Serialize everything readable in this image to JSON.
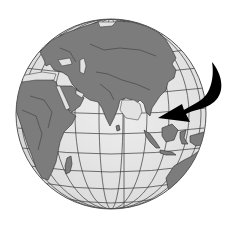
{
  "figure": {
    "view": "Eastern hemisphere centered on Indian Ocean",
    "style": "grayscale clip art",
    "regions_visible": [
      "Europe",
      "Asia",
      "Middle East",
      "Africa",
      "India",
      "Sri Lanka",
      "Southeast Asia",
      "Indonesia",
      "Australia",
      "Madagascar",
      "Indian Ocean"
    ],
    "annotation": {
      "type": "curved-arrow",
      "points_to": "Southeast Asia",
      "color": "#000000"
    },
    "colors": {
      "background": "#ffffff",
      "ocean": "#e2e2e2",
      "land": "#7c7c7c",
      "grid": "#3a3a3a",
      "arrow": "#000000"
    }
  }
}
